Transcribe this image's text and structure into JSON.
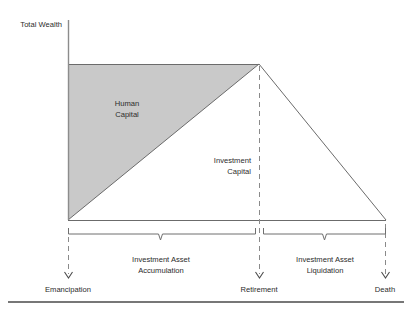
{
  "figure": {
    "type": "diagram",
    "title_text": "",
    "axis": {
      "y_axis_label": "Total Wealth"
    },
    "regions": [
      {
        "id": "human-capital",
        "label_line1": "Human",
        "label_line2": "Capital",
        "fill_color": "#c9c9c9",
        "shape": "triangle",
        "description": "Declines linearly from emancipation to retirement"
      },
      {
        "id": "investment-capital",
        "label_line1": "Investment",
        "label_line2": "Capital",
        "fill_color": "#ffffff",
        "shape": "triangle",
        "description": "Rises linearly from emancipation to retirement then falls to death"
      }
    ],
    "phases": [
      {
        "id": "accumulation",
        "label_line1": "Investment Asset",
        "label_line2": "Accumulation",
        "from": "Emancipation",
        "to": "Retirement"
      },
      {
        "id": "liquidation",
        "label_line1": "Investment Asset",
        "label_line2": "Liquidation",
        "from": "Retirement",
        "to": "Death"
      }
    ],
    "milestones": [
      {
        "id": "emancipation",
        "label": "Emancipation"
      },
      {
        "id": "retirement",
        "label": "Retirement"
      },
      {
        "id": "death",
        "label": "Death"
      }
    ],
    "colors": {
      "line": "#5a5a5a",
      "shade": "#c9c9c9",
      "shade_edge": "#6b6b6b",
      "dashed": "#8a8a8a",
      "rule": "#4a4a4a",
      "text": "#2b2b2b"
    }
  }
}
